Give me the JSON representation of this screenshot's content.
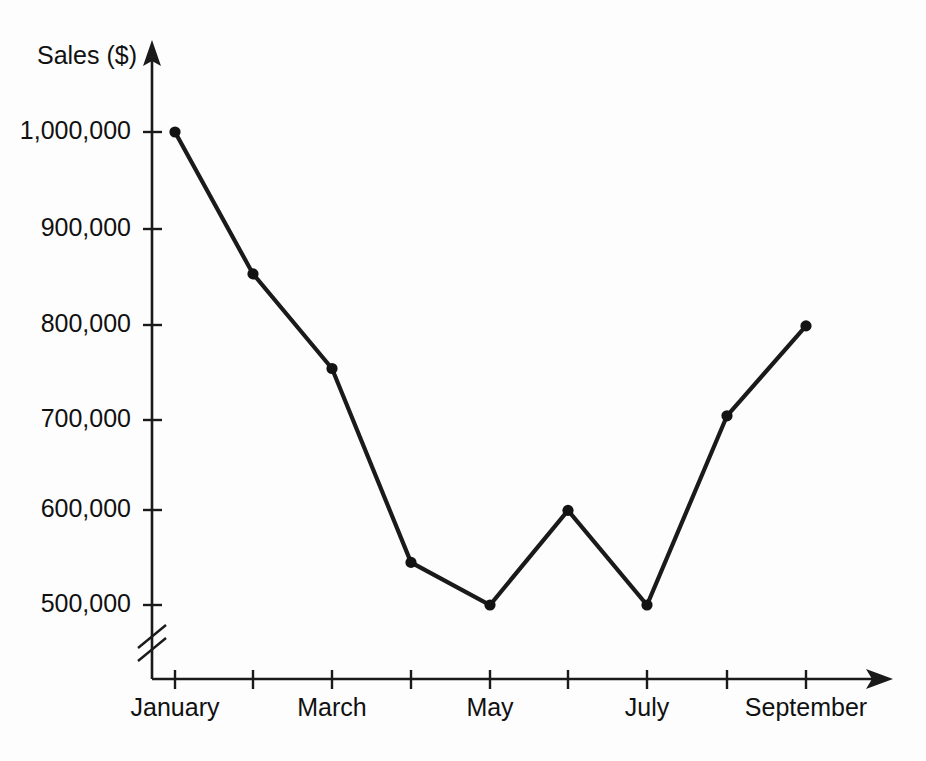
{
  "chart_data": {
    "type": "line",
    "title": "",
    "xlabel": "",
    "ylabel": "Sales ($)",
    "categories": [
      "January",
      "February",
      "March",
      "April",
      "May",
      "June",
      "July",
      "August",
      "September"
    ],
    "values": [
      1000000,
      850000,
      750000,
      545000,
      500000,
      600000,
      500000,
      700000,
      795000
    ],
    "series": [
      {
        "name": "Sales",
        "values": [
          1000000,
          850000,
          750000,
          545000,
          500000,
          600000,
          500000,
          700000,
          795000
        ]
      }
    ],
    "x_tick_labels": [
      "January",
      "",
      "March",
      "",
      "May",
      "",
      "July",
      "",
      "September"
    ],
    "y_tick_labels": [
      "500,000",
      "600,000",
      "700,000",
      "800,000",
      "900,000",
      "1,000,000"
    ],
    "y_tick_values": [
      500000,
      600000,
      700000,
      800000,
      900000,
      1000000
    ],
    "ylim": [
      500000,
      1000000
    ],
    "y_axis_break": true,
    "grid": false,
    "legend": false,
    "marker": "filled-circle",
    "line_color": "#1a1a1a",
    "background_color": "#fdfdfd"
  },
  "axis": {
    "y_title": "Sales ($)",
    "y_labels": {
      "t500": "500,000",
      "t600": "600,000",
      "t700": "700,000",
      "t800": "800,000",
      "t900": "900,000",
      "t1000": "1,000,000"
    },
    "x_labels": {
      "january": "January",
      "march": "March",
      "may": "May",
      "july": "July",
      "september": "September"
    }
  }
}
